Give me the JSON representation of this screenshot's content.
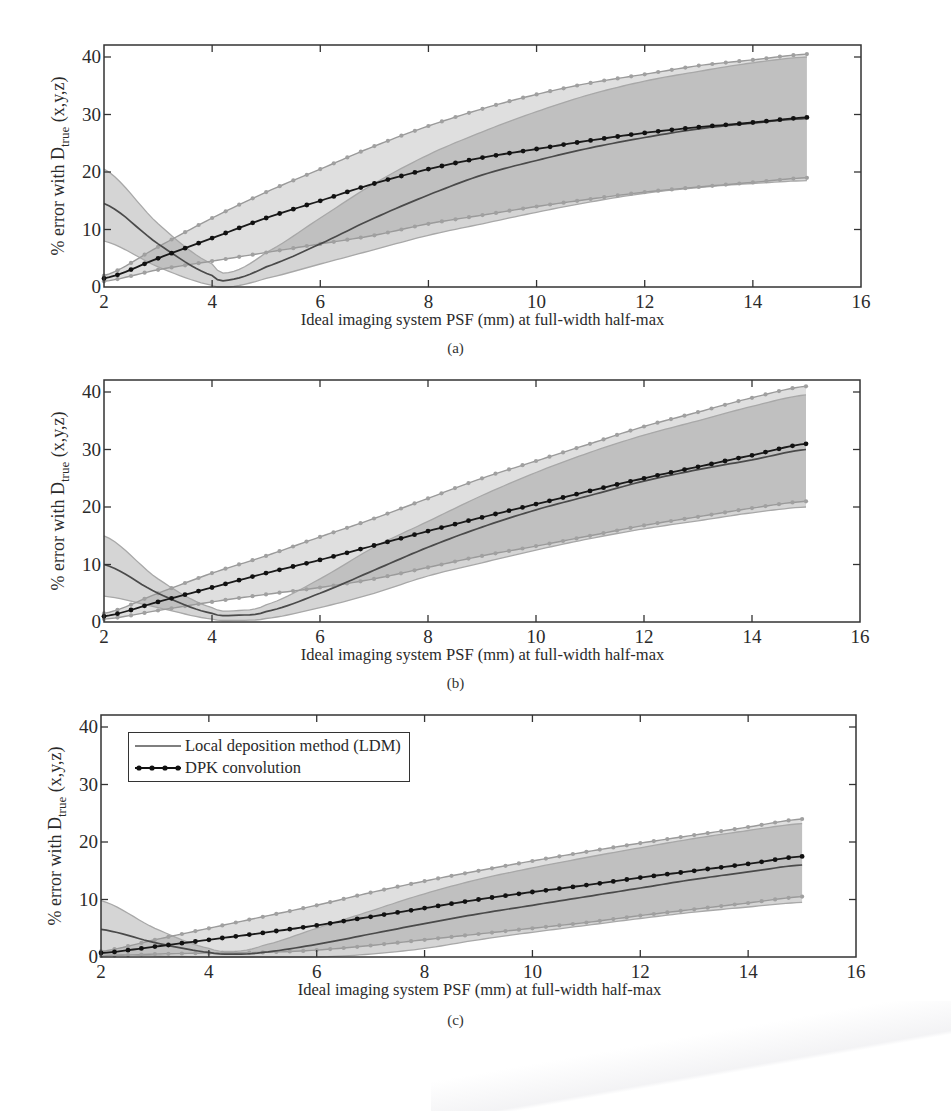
{
  "figure": {
    "panels": [
      {
        "id": "a",
        "caption": "(a)"
      },
      {
        "id": "b",
        "caption": "(b)"
      },
      {
        "id": "c",
        "caption": "(c)"
      }
    ],
    "xlabel": "Ideal imaging system PSF (mm) at full-width half-max",
    "ylabel_prefix": "% error with D",
    "ylabel_subscript": "true",
    "ylabel_suffix": " (x,y,z)",
    "x_ticks": [
      "2",
      "4",
      "6",
      "8",
      "10",
      "12",
      "14",
      "16"
    ],
    "y_ticks": [
      "0",
      "10",
      "20",
      "30",
      "40"
    ],
    "legend": {
      "ldm_label": "Local deposition method (LDM)",
      "dpk_label": "DPK convolution"
    },
    "colors": {
      "dpk_line": "#1a1a1a",
      "dpk_band_edge": "#9a9a9a",
      "ldm_line": "#4a4a4a",
      "ldm_band_edge": "#a8a8a8",
      "band_fill": "#d9d9d9",
      "overlap_fill": "#b5b5b5",
      "axis": "#333333"
    }
  },
  "chart_data": [
    {
      "panel": "a",
      "type": "line",
      "title": "",
      "xlabel": "Ideal imaging system PSF (mm) at full-width half-max",
      "ylabel": "% error with D_true (x,y,z)",
      "xlim": [
        2,
        16
      ],
      "ylim": [
        0,
        42
      ],
      "x_ticks": [
        2,
        4,
        6,
        8,
        10,
        12,
        14,
        16
      ],
      "y_ticks": [
        0,
        10,
        20,
        30,
        40
      ],
      "grid": false,
      "legend_position": "none",
      "x": [
        2,
        3,
        4,
        5,
        6,
        7,
        8,
        9,
        10,
        11,
        12,
        13,
        14,
        15
      ],
      "series": [
        {
          "name": "DPK convolution",
          "style": "line-with-markers",
          "values": [
            1.5,
            5,
            8.5,
            12,
            15,
            18,
            20.5,
            22.5,
            24,
            25.5,
            26.8,
            27.8,
            28.6,
            29.5
          ],
          "band_upper": [
            2,
            7,
            12,
            16.5,
            20.5,
            24.5,
            28,
            31,
            33.5,
            35.5,
            37,
            38.5,
            39.5,
            40.5
          ],
          "band_lower": [
            1,
            3,
            4.5,
            6,
            7.5,
            9,
            11,
            12.5,
            14,
            15.3,
            16.5,
            17.4,
            18.2,
            19
          ]
        },
        {
          "name": "Local deposition method (LDM)",
          "style": "line",
          "x": [
            2,
            3,
            4,
            4.3,
            5,
            6,
            7,
            8,
            9,
            10,
            11,
            12,
            13,
            14,
            15
          ],
          "values": [
            14.5,
            7.5,
            2,
            1.2,
            3.5,
            7.5,
            12,
            16,
            19.5,
            22,
            24.2,
            26,
            27.5,
            28.5,
            29.3
          ],
          "band_upper": [
            20.5,
            11,
            4,
            2.5,
            6,
            12,
            18,
            23,
            27,
            30.5,
            33.5,
            35.8,
            37.5,
            39,
            40
          ],
          "band_lower": [
            8,
            3.5,
            0.3,
            0,
            1.5,
            4,
            6.5,
            9,
            11,
            13,
            14.8,
            16.3,
            17.3,
            18,
            18.5
          ]
        }
      ]
    },
    {
      "panel": "b",
      "type": "line",
      "title": "",
      "xlabel": "Ideal imaging system PSF (mm) at full-width half-max",
      "ylabel": "% error with D_true (x,y,z)",
      "xlim": [
        2,
        16
      ],
      "ylim": [
        0,
        42
      ],
      "x_ticks": [
        2,
        4,
        6,
        8,
        10,
        12,
        14,
        16
      ],
      "y_ticks": [
        0,
        10,
        20,
        30,
        40
      ],
      "grid": false,
      "legend_position": "none",
      "x": [
        2,
        3,
        4,
        5,
        6,
        7,
        8,
        9,
        10,
        11,
        12,
        13,
        14,
        15
      ],
      "series": [
        {
          "name": "DPK convolution",
          "style": "line-with-markers",
          "values": [
            1,
            3.5,
            6,
            8.5,
            10.8,
            13.3,
            15.8,
            18.2,
            20.5,
            22.8,
            25,
            27,
            29,
            31
          ],
          "band_upper": [
            1.5,
            5,
            8.5,
            11.5,
            14.8,
            18,
            21.5,
            25,
            28,
            31,
            34,
            36.5,
            39,
            41
          ],
          "band_lower": [
            0.5,
            2,
            3.5,
            4.8,
            6,
            7.5,
            9.5,
            11.5,
            13.2,
            15,
            16.8,
            18.3,
            19.8,
            21
          ]
        },
        {
          "name": "Local deposition method (LDM)",
          "style": "line",
          "x": [
            2,
            3,
            4,
            4.5,
            5,
            6,
            7,
            8,
            9,
            10,
            11,
            12,
            13,
            14,
            15
          ],
          "values": [
            10,
            5,
            1.5,
            1.2,
            1.8,
            5,
            9,
            13,
            16.5,
            19.5,
            22,
            24.5,
            26.5,
            28.2,
            30
          ],
          "band_upper": [
            15,
            7.5,
            2.5,
            2,
            3,
            7.5,
            13,
            17.5,
            22,
            26,
            29.5,
            32.5,
            35,
            37.5,
            39.5
          ],
          "band_lower": [
            4.5,
            2.5,
            0.5,
            0.3,
            0.6,
            2.5,
            5,
            8,
            10.3,
            12.5,
            14.5,
            16.2,
            17.6,
            19,
            20
          ]
        }
      ]
    },
    {
      "panel": "c",
      "type": "line",
      "title": "",
      "xlabel": "Ideal imaging system PSF (mm) at full-width half-max",
      "ylabel": "% error with D_true (x,y,z)",
      "xlim": [
        2,
        16
      ],
      "ylim": [
        0,
        42
      ],
      "x_ticks": [
        2,
        4,
        6,
        8,
        10,
        12,
        14,
        16
      ],
      "y_ticks": [
        0,
        10,
        20,
        30,
        40
      ],
      "grid": false,
      "legend_position": "upper left",
      "legend": [
        "Local deposition method (LDM)",
        "DPK convolution"
      ],
      "x": [
        2,
        3,
        4,
        5,
        6,
        7,
        8,
        9,
        10,
        11,
        12,
        13,
        14,
        15
      ],
      "series": [
        {
          "name": "DPK convolution",
          "style": "line-with-markers",
          "values": [
            0.7,
            1.8,
            3,
            4.2,
            5.5,
            7,
            8.5,
            10,
            11.3,
            12.5,
            13.8,
            15,
            16.2,
            17.5
          ],
          "band_upper": [
            1,
            3,
            5,
            7,
            9,
            11.2,
            13.2,
            15,
            16.7,
            18.3,
            19.8,
            21.2,
            22.6,
            24
          ],
          "band_lower": [
            0.2,
            0.5,
            0.7,
            0.8,
            1.2,
            2,
            3,
            4,
            5,
            6,
            7.2,
            8.3,
            9.4,
            10.5
          ]
        },
        {
          "name": "Local deposition method (LDM)",
          "style": "line",
          "x": [
            2,
            3,
            4,
            4.5,
            5,
            6,
            7,
            8,
            9,
            10,
            11,
            12,
            13,
            14,
            15
          ],
          "values": [
            4.8,
            2.5,
            0.8,
            0.5,
            0.8,
            2.2,
            4,
            5.8,
            7.5,
            9,
            10.5,
            12,
            13.5,
            14.8,
            16
          ],
          "band_upper": [
            9.8,
            5,
            1.5,
            1,
            2,
            5,
            8,
            11,
            13.5,
            15.5,
            17.3,
            19,
            20.6,
            22,
            23.2
          ],
          "band_lower": [
            0.5,
            0.2,
            0,
            0,
            0,
            0,
            0.5,
            1.5,
            3,
            4.3,
            5.5,
            6.7,
            7.8,
            8.7,
            9.5
          ]
        }
      ]
    }
  ]
}
